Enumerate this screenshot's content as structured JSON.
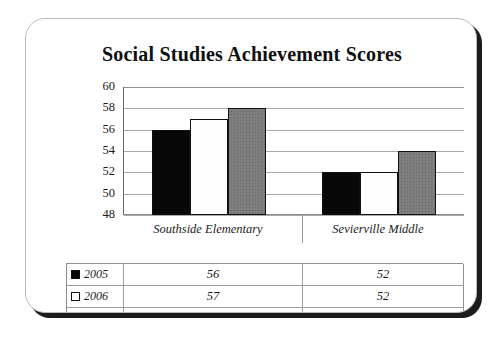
{
  "card": {
    "title": "Social Studies Achievement Scores"
  },
  "chart_data": {
    "type": "bar",
    "title": "Social Studies Achievement Scores",
    "xlabel": "",
    "ylabel": "",
    "ylim": [
      48,
      60
    ],
    "yticks": [
      60,
      58,
      56,
      54,
      52,
      50,
      48
    ],
    "grid": true,
    "legend_position": "table-below",
    "categories": [
      "Southside Elementary",
      "Sevierville Middle"
    ],
    "series": [
      {
        "name": "2005",
        "values": [
          56,
          52
        ],
        "color": "#080808",
        "pattern": "dotted-dark"
      },
      {
        "name": "2006",
        "values": [
          57,
          52
        ],
        "color": "#ffffff",
        "pattern": "dotted-light"
      },
      {
        "name": "2007",
        "values": [
          58,
          54
        ],
        "color": "#7e7e7e",
        "pattern": "checkered-gray"
      }
    ]
  },
  "table": {
    "row_header_labels": [
      "2005",
      "2006",
      "2007"
    ],
    "column_headers": [
      "Southside Elementary",
      "Sevierville Middle"
    ],
    "rows": [
      {
        "label": "2005",
        "cells": [
          "56",
          "52"
        ]
      },
      {
        "label": "2006",
        "cells": [
          "57",
          "52"
        ]
      },
      {
        "label": "2007",
        "cells": [
          "58",
          "54"
        ]
      }
    ]
  },
  "colors": {
    "series_2005": "#080808",
    "series_2006": "#ffffff",
    "series_2007": "#7e7e7e",
    "gridline": "#a9a9a9",
    "text": "#1b1b1b",
    "card_shadow": "#1c1c1c"
  }
}
